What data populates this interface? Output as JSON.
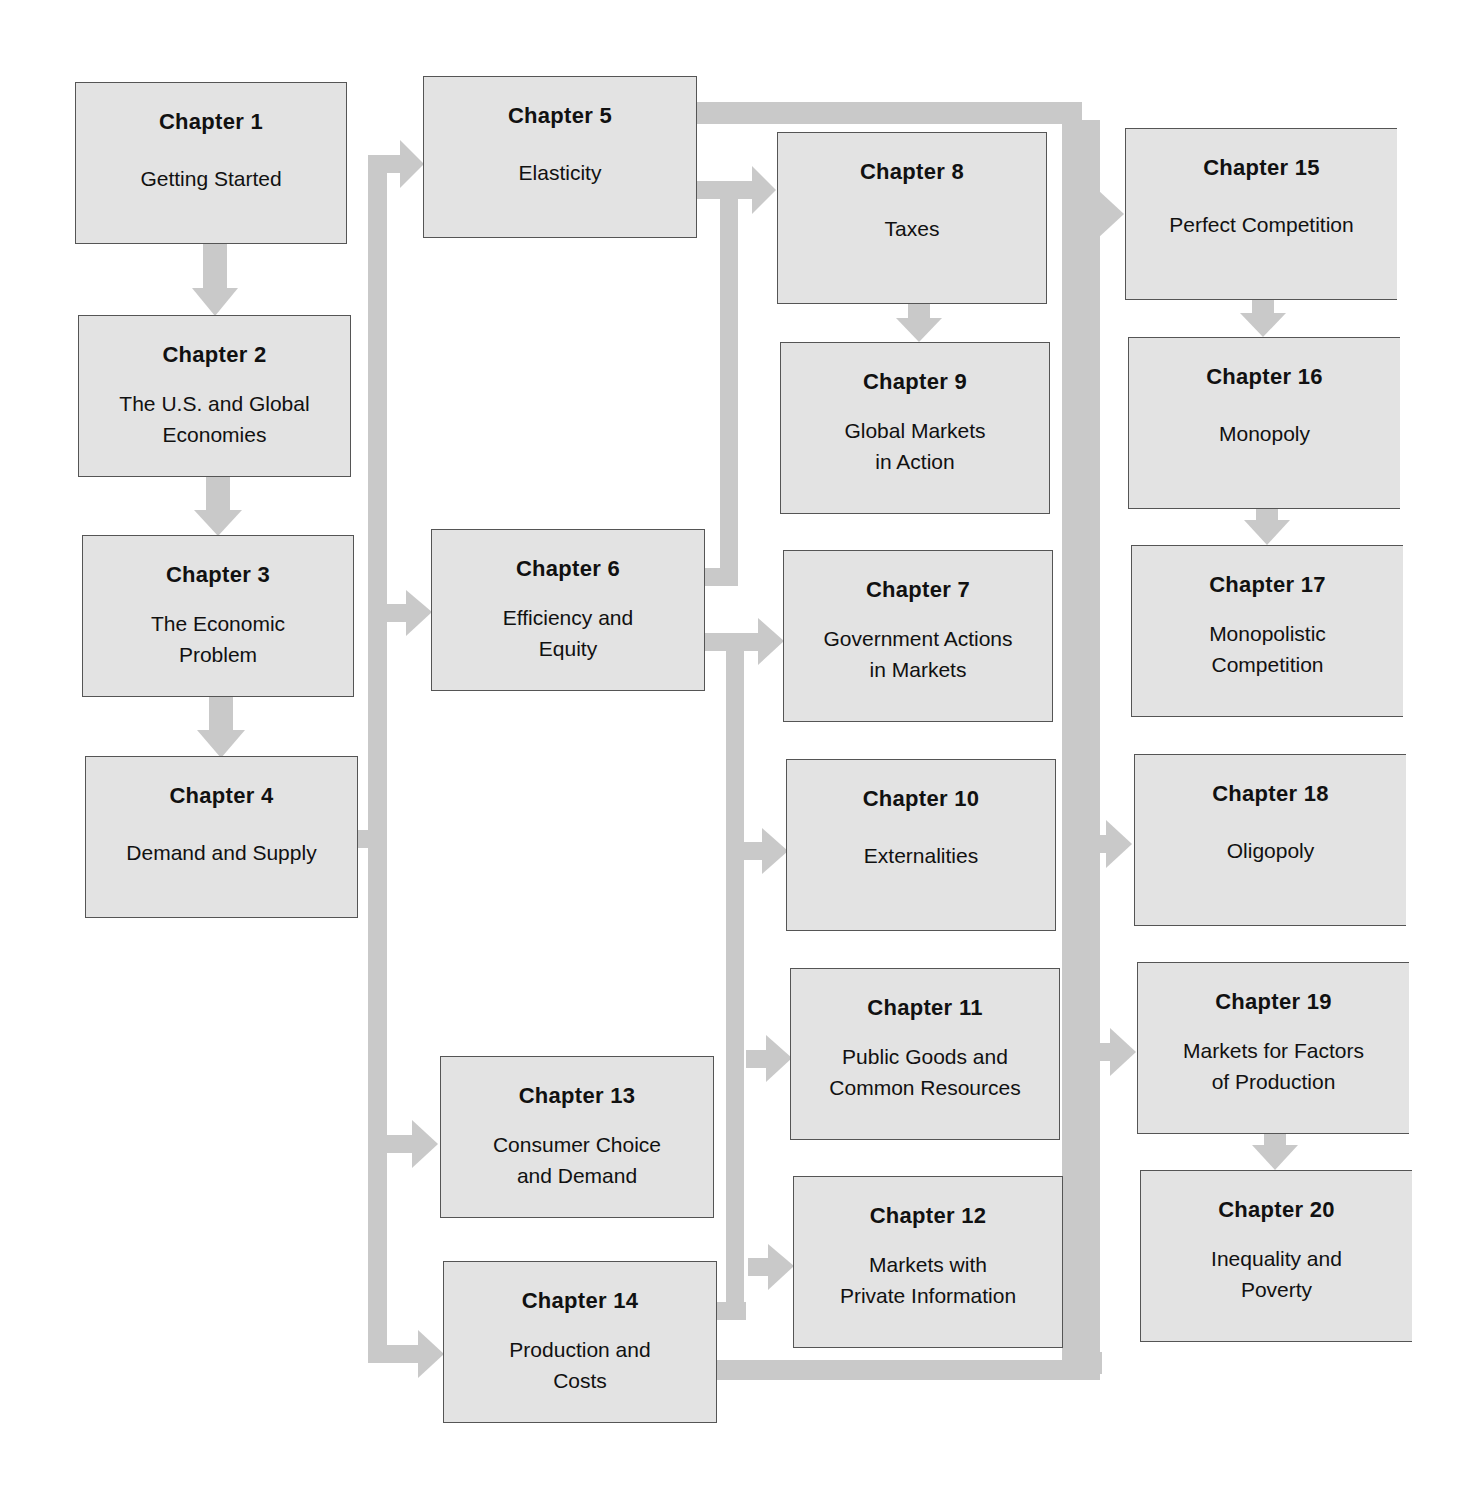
{
  "diagram": {
    "colors": {
      "box_fill": "#e3e3e3",
      "box_border": "#555555",
      "connector": "#c9c9c9",
      "text": "#111111"
    },
    "chapters": [
      {
        "id": 1,
        "label": "Chapter 1",
        "title": "Getting Started"
      },
      {
        "id": 2,
        "label": "Chapter 2",
        "title": "The U.S. and Global\nEconomies"
      },
      {
        "id": 3,
        "label": "Chapter 3",
        "title": "The Economic\nProblem"
      },
      {
        "id": 4,
        "label": "Chapter 4",
        "title": "Demand and Supply"
      },
      {
        "id": 5,
        "label": "Chapter 5",
        "title": "Elasticity"
      },
      {
        "id": 6,
        "label": "Chapter 6",
        "title": "Efficiency and\nEquity"
      },
      {
        "id": 7,
        "label": "Chapter 7",
        "title": "Government Actions\nin Markets"
      },
      {
        "id": 8,
        "label": "Chapter 8",
        "title": "Taxes"
      },
      {
        "id": 9,
        "label": "Chapter 9",
        "title": "Global Markets\nin Action"
      },
      {
        "id": 10,
        "label": "Chapter 10",
        "title": "Externalities"
      },
      {
        "id": 11,
        "label": "Chapter 11",
        "title": "Public Goods and\nCommon Resources"
      },
      {
        "id": 12,
        "label": "Chapter 12",
        "title": "Markets with\nPrivate Information"
      },
      {
        "id": 13,
        "label": "Chapter 13",
        "title": "Consumer Choice\nand Demand"
      },
      {
        "id": 14,
        "label": "Chapter 14",
        "title": "Production and\nCosts"
      },
      {
        "id": 15,
        "label": "Chapter 15",
        "title": "Perfect Competition"
      },
      {
        "id": 16,
        "label": "Chapter 16",
        "title": "Monopoly"
      },
      {
        "id": 17,
        "label": "Chapter 17",
        "title": "Monopolistic\nCompetition"
      },
      {
        "id": 18,
        "label": "Chapter 18",
        "title": "Oligopoly"
      },
      {
        "id": 19,
        "label": "Chapter 19",
        "title": "Markets for Factors\nof Production"
      },
      {
        "id": 20,
        "label": "Chapter 20",
        "title": "Inequality and\nPoverty"
      }
    ],
    "flows": [
      [
        "Chapter 1",
        "Chapter 2"
      ],
      [
        "Chapter 2",
        "Chapter 3"
      ],
      [
        "Chapter 3",
        "Chapter 4"
      ],
      [
        "Chapter 4",
        "Chapter 5"
      ],
      [
        "Chapter 4",
        "Chapter 6"
      ],
      [
        "Chapter 4",
        "Chapter 13"
      ],
      [
        "Chapter 4",
        "Chapter 14"
      ],
      [
        "Chapter 5",
        "Chapter 8"
      ],
      [
        "Chapter 6",
        "Chapter 8"
      ],
      [
        "Chapter 8",
        "Chapter 9"
      ],
      [
        "Chapter 6",
        "Chapter 7"
      ],
      [
        "Chapter 6",
        "Chapter 10"
      ],
      [
        "Chapter 6",
        "Chapter 11"
      ],
      [
        "Chapter 6",
        "Chapter 12"
      ],
      [
        "Chapter 14",
        "Chapter 10"
      ],
      [
        "Chapter 14",
        "Chapter 11"
      ],
      [
        "Chapter 14",
        "Chapter 12"
      ],
      [
        "Chapter 5",
        "Chapter 15"
      ],
      [
        "Chapter 5",
        "Chapter 18"
      ],
      [
        "Chapter 5",
        "Chapter 19"
      ],
      [
        "Chapter 14",
        "Chapter 15"
      ],
      [
        "Chapter 14",
        "Chapter 18"
      ],
      [
        "Chapter 14",
        "Chapter 19"
      ],
      [
        "Chapter 15",
        "Chapter 16"
      ],
      [
        "Chapter 16",
        "Chapter 17"
      ],
      [
        "Chapter 19",
        "Chapter 20"
      ]
    ]
  }
}
